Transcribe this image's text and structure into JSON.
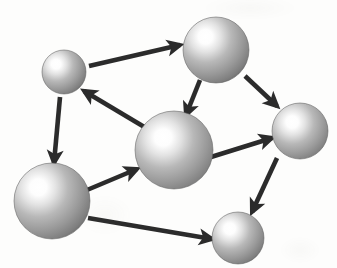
{
  "diagram": {
    "type": "directed-graph",
    "canvas": {
      "width": 337,
      "height": 268,
      "background": "#fdfdfc"
    },
    "style": {
      "sphere_highlight_color": "#ffffff",
      "sphere_mid_color": "#b8b8b8",
      "sphere_edge_color": "#7e7e7e",
      "sphere_rim_color": "#6a6a6a",
      "arrow_color": "#2b2b2b",
      "arrow_width": 4.6
    },
    "nodes": [
      {
        "id": "n1",
        "label": "top-left-small-node",
        "cx": 64,
        "cy": 72,
        "r": 22,
        "size": "small",
        "highlight_dx": -0.18,
        "highlight_dy": -0.18
      },
      {
        "id": "n2",
        "label": "top-right-large-node",
        "cx": 216,
        "cy": 50,
        "r": 33,
        "size": "large",
        "highlight_dx": -0.16,
        "highlight_dy": -0.2
      },
      {
        "id": "n3",
        "label": "center-large-node",
        "cx": 174,
        "cy": 150,
        "r": 39,
        "size": "large",
        "highlight_dx": -0.14,
        "highlight_dy": -0.16
      },
      {
        "id": "n4",
        "label": "bottom-left-large-node",
        "cx": 52,
        "cy": 201,
        "r": 38,
        "size": "large",
        "highlight_dx": -0.18,
        "highlight_dy": -0.18
      },
      {
        "id": "n5",
        "label": "right-medium-node",
        "cx": 300,
        "cy": 131,
        "r": 28,
        "size": "medium",
        "highlight_dx": -0.14,
        "highlight_dy": -0.16
      },
      {
        "id": "n6",
        "label": "bottom-right-small-node",
        "cx": 238,
        "cy": 238,
        "r": 26,
        "size": "small",
        "highlight_dx": -0.16,
        "highlight_dy": -0.18
      }
    ],
    "edges": [
      {
        "id": "e1",
        "label": "edge-top-left-to-top-right",
        "from": "n1",
        "to": "n2",
        "x1": 89,
        "y1": 66,
        "x2": 180,
        "y2": 45,
        "head": "end"
      },
      {
        "id": "e2",
        "label": "edge-top-right-to-center",
        "from": "n2",
        "to": "n3",
        "x1": 200,
        "y1": 80,
        "x2": 186,
        "y2": 115,
        "head": "end"
      },
      {
        "id": "e3",
        "label": "edge-top-right-to-right",
        "from": "n2",
        "to": "n5",
        "x1": 245,
        "y1": 76,
        "x2": 277,
        "y2": 106,
        "head": "end"
      },
      {
        "id": "e4",
        "label": "edge-center-to-top-left",
        "from": "n3",
        "to": "n1",
        "x1": 146,
        "y1": 128,
        "x2": 84,
        "y2": 91,
        "head": "end"
      },
      {
        "id": "e5",
        "label": "edge-top-left-to-bottom-left",
        "from": "n1",
        "to": "n4",
        "x1": 60,
        "y1": 97,
        "x2": 54,
        "y2": 163,
        "head": "end"
      },
      {
        "id": "e6",
        "label": "edge-bottom-left-to-center",
        "from": "n4",
        "to": "n3",
        "x1": 87,
        "y1": 190,
        "x2": 137,
        "y2": 169,
        "head": "end"
      },
      {
        "id": "e7",
        "label": "edge-center-to-right",
        "from": "n3",
        "to": "n5",
        "x1": 211,
        "y1": 157,
        "x2": 272,
        "y2": 138,
        "head": "end"
      },
      {
        "id": "e8",
        "label": "edge-bottom-left-to-bottom-right",
        "from": "n4",
        "to": "n6",
        "x1": 88,
        "y1": 218,
        "x2": 212,
        "y2": 239,
        "head": "end"
      },
      {
        "id": "e9",
        "label": "edge-right-to-bottom-right",
        "from": "n5",
        "to": "n6",
        "x1": 277,
        "y1": 158,
        "x2": 252,
        "y2": 212,
        "head": "end"
      }
    ]
  }
}
